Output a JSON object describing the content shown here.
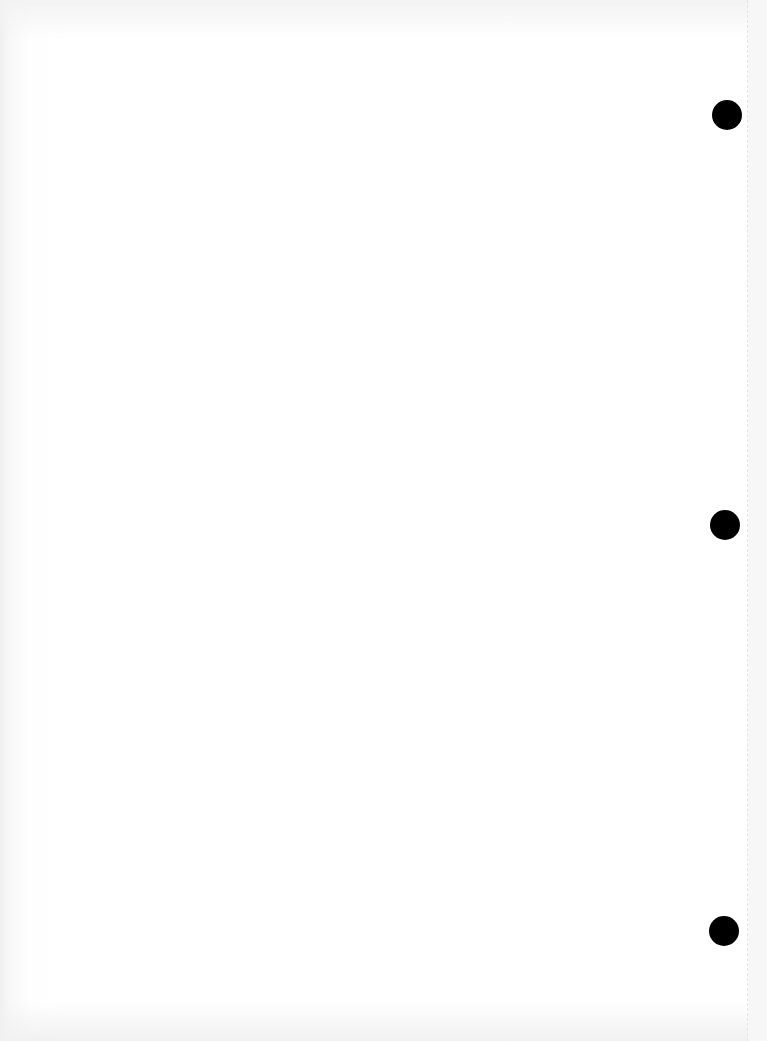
{
  "document": {
    "type": "scanned-blank-page",
    "background_color": "#ffffff",
    "bleed_through_text": {
      "line1": "",
      "line2": "",
      "line3": "",
      "line4": ""
    },
    "punch_holes": [
      {
        "label": "punch-hole-top",
        "color": "#000000"
      },
      {
        "label": "punch-hole-middle",
        "color": "#000000"
      },
      {
        "label": "punch-hole-bottom",
        "color": "#000000"
      }
    ]
  }
}
